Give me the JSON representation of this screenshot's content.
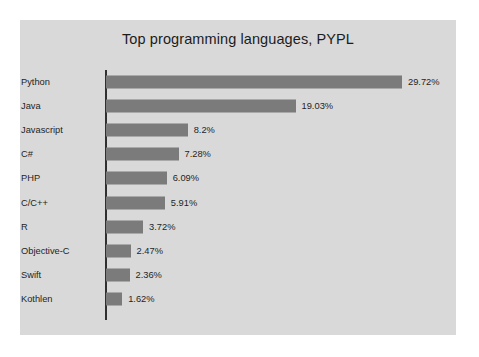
{
  "chart_data": {
    "type": "bar",
    "orientation": "horizontal",
    "title": "Top programming languages, PYPL",
    "xlabel": "",
    "ylabel": "",
    "xlim": [
      0,
      29.72
    ],
    "grid": false,
    "legend": null,
    "value_suffix": "%",
    "categories": [
      "Python",
      "Java",
      "Javascript",
      "C#",
      "PHP",
      "C/C++",
      "R",
      "Objective-C",
      "Swift",
      "Kothlen"
    ],
    "values": [
      29.72,
      19.03,
      8.2,
      7.28,
      6.09,
      5.91,
      3.72,
      2.47,
      2.36,
      1.62
    ],
    "value_labels": [
      "29.72%",
      "19.03%",
      "8.2%",
      "7.28%",
      "6.09%",
      "5.91%",
      "3.72%",
      "2.47%",
      "2.36%",
      "1.62%"
    ],
    "bars": [
      {
        "category": "Python",
        "value": 29.72,
        "label": "29.72%"
      },
      {
        "category": "Java",
        "value": 19.03,
        "label": "19.03%"
      },
      {
        "category": "Javascript",
        "value": 8.2,
        "label": "8.2%"
      },
      {
        "category": "C#",
        "value": 7.28,
        "label": "7.28%"
      },
      {
        "category": "PHP",
        "value": 6.09,
        "label": "6.09%"
      },
      {
        "category": "C/C++",
        "value": 5.91,
        "label": "5.91%"
      },
      {
        "category": "R",
        "value": 3.72,
        "label": "3.72%"
      },
      {
        "category": "Objective-C",
        "value": 2.47,
        "label": "2.47%"
      },
      {
        "category": "Swift",
        "value": 2.36,
        "label": "2.36%"
      },
      {
        "category": "Kothlen",
        "value": 1.62,
        "label": "1.62%"
      }
    ],
    "colors": {
      "bar": "#7b7b7b",
      "panel_background": "#d9d9d9",
      "figure_background": "#ffffff",
      "axis": "#303030",
      "text": "#1f1f1f"
    }
  }
}
